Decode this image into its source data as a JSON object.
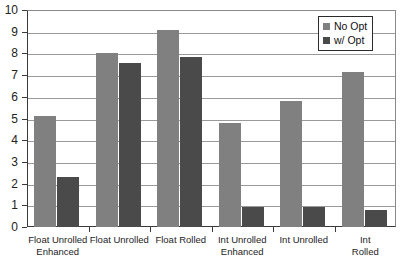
{
  "chart_data": {
    "type": "bar",
    "title": "",
    "subtitle": "",
    "xlabel": "",
    "ylabel": "",
    "ylim": [
      0,
      10
    ],
    "yticks": [
      0,
      1,
      2,
      3,
      4,
      5,
      6,
      7,
      8,
      9,
      10
    ],
    "ytick_labels": [
      "0",
      "1",
      "2",
      "3",
      "4",
      "5",
      "6",
      "7",
      "8",
      "9",
      "10"
    ],
    "grid": true,
    "grid_axis": "y",
    "legend_position": "top-right",
    "categories": [
      "Float Unrolled\nEnhanced",
      "Float Unrolled",
      "Float Rolled",
      "Int Unrolled\nEnhanced",
      "Int Unrolled",
      "Int Rolled"
    ],
    "series": [
      {
        "name": "No Opt",
        "color": "#808080",
        "values": [
          5.1,
          8.0,
          9.1,
          4.8,
          5.8,
          7.15
        ]
      },
      {
        "name": "w/ Opt",
        "color": "#4a4a4a",
        "values": [
          2.3,
          7.55,
          7.85,
          0.9,
          0.9,
          0.8
        ]
      }
    ]
  },
  "legend": {
    "items": [
      {
        "label": "No Opt",
        "color": "#808080"
      },
      {
        "label": "w/ Opt",
        "color": "#4a4a4a"
      }
    ]
  },
  "colors": {
    "series_no_opt": "#808080",
    "series_w_opt": "#4a4a4a",
    "axis": "#3a3a3a",
    "gridline": "#9a9a9a",
    "background": "#ffffff"
  }
}
